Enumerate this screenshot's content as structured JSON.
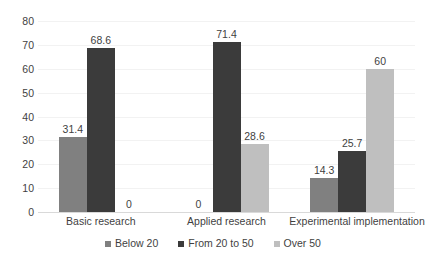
{
  "chart_data": {
    "type": "bar",
    "title": "",
    "subtitle": "",
    "xlabel": "",
    "ylabel": "",
    "ylim": [
      0,
      80
    ],
    "ytick_step": 10,
    "yticks": [
      "80",
      "70",
      "60",
      "50",
      "40",
      "30",
      "20",
      "10",
      "0"
    ],
    "grid": true,
    "legend_position": "bottom",
    "categories": [
      "Basic research",
      "Applied research",
      "Experimental implementation"
    ],
    "series": [
      {
        "name": "Below 20",
        "color": "#808080",
        "values": [
          31.4,
          0,
          14.3
        ],
        "labels": [
          "31.4",
          "0",
          "14.3"
        ]
      },
      {
        "name": "From 20 to 50",
        "color": "#3b3b3b",
        "values": [
          68.6,
          71.4,
          25.7
        ],
        "labels": [
          "68.6",
          "71.4",
          "25.7"
        ]
      },
      {
        "name": "Over 50",
        "color": "#bfbfbf",
        "values": [
          0,
          28.6,
          60
        ],
        "labels": [
          "0",
          "28.6",
          "60"
        ]
      }
    ]
  },
  "axis": {
    "y_ticks": [
      {
        "label": "80",
        "value": 80
      },
      {
        "label": "70",
        "value": 70
      },
      {
        "label": "60",
        "value": 60
      },
      {
        "label": "50",
        "value": 50
      },
      {
        "label": "40",
        "value": 40
      },
      {
        "label": "30",
        "value": 30
      },
      {
        "label": "20",
        "value": 20
      },
      {
        "label": "10",
        "value": 10
      },
      {
        "label": "0",
        "value": 0
      }
    ]
  },
  "legend": {
    "items": [
      {
        "label": "Below 20",
        "series": 0
      },
      {
        "label": "From 20 to 50",
        "series": 1
      },
      {
        "label": "Over 50",
        "series": 2
      }
    ]
  },
  "colors": {
    "series_below_20": "#808080",
    "series_from_20_to_50": "#3b3b3b",
    "series_over_50": "#bfbfbf",
    "gridline": "#f2f2f2",
    "axis_line": "#d9d9d9",
    "text": "#3f3f3f",
    "background": "#ffffff"
  }
}
